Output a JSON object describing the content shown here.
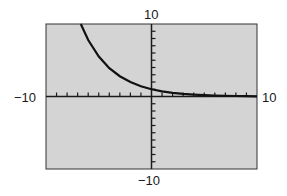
{
  "chart_data": {
    "type": "line",
    "title": "",
    "xlabel": "",
    "ylabel": "",
    "xlim": [
      -10,
      10
    ],
    "ylim": [
      -10,
      10
    ],
    "x_tick_step": 1,
    "y_tick_step": 1,
    "grid": false,
    "legend": null,
    "tick_labels": {
      "x_min": "−10",
      "x_max": "10",
      "y_min": "−10",
      "y_max": "10"
    },
    "series": [
      {
        "name": "decaying exponential",
        "color": "#111111",
        "x": [
          -6.7,
          -6,
          -5,
          -4,
          -3,
          -2,
          -1,
          0,
          1,
          2,
          3,
          4,
          5,
          6,
          7,
          8,
          9,
          10
        ],
        "y": [
          10.0,
          7.8,
          5.5,
          3.9,
          2.8,
          2.0,
          1.4,
          1.0,
          0.71,
          0.51,
          0.36,
          0.26,
          0.18,
          0.13,
          0.09,
          0.07,
          0.05,
          0.03
        ]
      }
    ]
  },
  "colors": {
    "plot_background": "#d4d4d4",
    "axis": "#1a1a1a",
    "frame": "#333333"
  }
}
